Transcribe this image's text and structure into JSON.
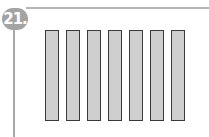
{
  "problem": {
    "number": "21."
  },
  "bars": {
    "count": 7,
    "fill": "#cfcfcf",
    "stroke": "#3a3a3a"
  },
  "colors": {
    "badge": "#a3a3a3",
    "frame": "#b0b0b0"
  }
}
